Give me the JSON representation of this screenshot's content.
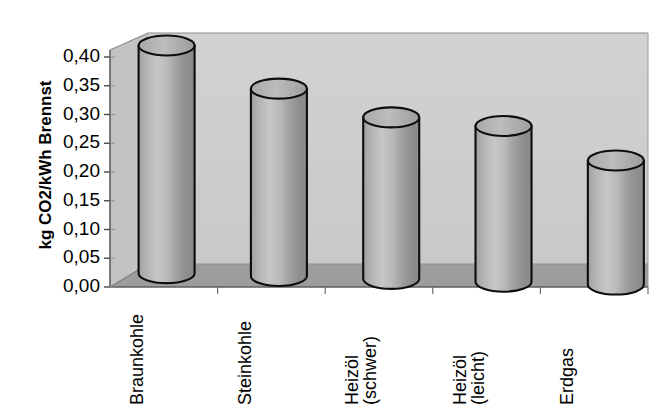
{
  "chart_data": {
    "type": "bar",
    "title": "",
    "subtitle": "",
    "xlabel": "",
    "ylabel": "kg CO2/kWh Brennst",
    "categories": [
      "Braunkohle",
      "Steinkohle",
      "Heizöl (schwer)",
      "Heizöl (leicht)",
      "Erdgas"
    ],
    "category_lines": [
      [
        "Braunkohle"
      ],
      [
        "Steinkohle"
      ],
      [
        "Heizöl",
        "(schwer)"
      ],
      [
        "Heizöl",
        "(leicht)"
      ],
      [
        "Erdgas"
      ]
    ],
    "values": [
      0.42,
      0.345,
      0.295,
      0.28,
      0.22
    ],
    "ylim": [
      0.0,
      0.4
    ],
    "ytick_values": [
      0.4,
      0.35,
      0.3,
      0.25,
      0.2,
      0.15,
      0.1,
      0.05,
      0.0
    ],
    "ytick_labels": [
      "0,40",
      "0,35",
      "0,30",
      "0,25",
      "0,20",
      "0,15",
      "0,10",
      "0,05",
      "0,00"
    ],
    "grid": false,
    "legend": null,
    "style": "3d-cylinder",
    "series": [
      {
        "name": "CO2-Emissionsfaktor",
        "values": [
          0.42,
          0.345,
          0.295,
          0.28,
          0.22
        ]
      }
    ],
    "colors": {
      "bar_light": "#bdbdbd",
      "bar_mid": "#9a9a9a",
      "bar_dark": "#7e7e7e",
      "bar_outline": "#101010",
      "wall_back": "#cfcfcf",
      "wall_side": "#c4c4c4",
      "floor": "#9c9c9c",
      "axis_line": "#4a4a4a",
      "text": "#000000",
      "background": "#ffffff"
    }
  }
}
